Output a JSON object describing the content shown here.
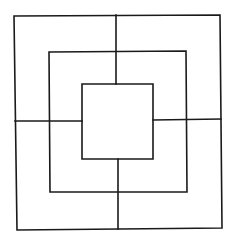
{
  "diagram": {
    "type": "nine-mens-morris-board",
    "stroke_color": "#1a1a1a",
    "background": "#ffffff",
    "squares": [
      {
        "name": "outer",
        "points": [
          [
            14,
            16
          ],
          [
            220,
            15
          ],
          [
            222,
            228
          ],
          [
            17,
            230
          ]
        ]
      },
      {
        "name": "middle",
        "points": [
          [
            49,
            52
          ],
          [
            186,
            51
          ],
          [
            187,
            192
          ],
          [
            50,
            192
          ]
        ]
      },
      {
        "name": "inner",
        "points": [
          [
            82,
            84
          ],
          [
            153,
            84
          ],
          [
            153,
            159
          ],
          [
            82,
            159
          ]
        ]
      }
    ],
    "connectors": [
      {
        "name": "top",
        "from": [
          116,
          15
        ],
        "to": [
          116,
          84
        ]
      },
      {
        "name": "bottom",
        "from": [
          118,
          159
        ],
        "to": [
          118,
          229
        ]
      },
      {
        "name": "left",
        "from": [
          15,
          121
        ],
        "to": [
          82,
          121
        ]
      },
      {
        "name": "right",
        "from": [
          153,
          120
        ],
        "to": [
          221,
          119
        ]
      }
    ]
  }
}
